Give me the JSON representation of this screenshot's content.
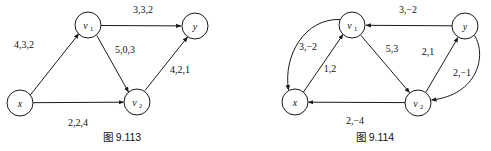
{
  "figures": [
    {
      "id": "fig-9-113",
      "caption": "图 9.113",
      "caption_x": 122,
      "caption_y": 141,
      "nodes": [
        {
          "id": "x",
          "label": "x",
          "sub": "",
          "cx": 20,
          "cy": 103,
          "r": 13
        },
        {
          "id": "v1",
          "label": "v",
          "sub": "1",
          "cx": 88,
          "cy": 25,
          "r": 13
        },
        {
          "id": "y",
          "label": "y",
          "sub": "",
          "cx": 195,
          "cy": 26,
          "r": 13
        },
        {
          "id": "v2",
          "label": "v",
          "sub": "2",
          "cx": 137,
          "cy": 102,
          "r": 13
        }
      ],
      "edges": [
        {
          "id": "x-v1",
          "from": "x",
          "to": "v1",
          "label": "4,3,2",
          "lx": 24,
          "ly": 48,
          "curve": 0
        },
        {
          "id": "v1-y",
          "from": "v1",
          "to": "y",
          "label": "3,3,2",
          "lx": 143,
          "ly": 13,
          "curve": 0
        },
        {
          "id": "v1-v2",
          "from": "v1",
          "to": "v2",
          "label": "5,0,3",
          "lx": 125,
          "ly": 53,
          "curve": 0
        },
        {
          "id": "x-v2",
          "from": "x",
          "to": "v2",
          "label": "2,2,4",
          "lx": 78,
          "ly": 126,
          "curve": 0
        },
        {
          "id": "v2-y",
          "from": "v2",
          "to": "y",
          "label": "4,2,1",
          "lx": 180,
          "ly": 73,
          "curve": 0
        }
      ]
    },
    {
      "id": "fig-9-114",
      "caption": "图 9.114",
      "caption_x": 375,
      "caption_y": 141,
      "nodes": [
        {
          "id": "x",
          "label": "x",
          "sub": "",
          "cx": 295,
          "cy": 102,
          "r": 13
        },
        {
          "id": "v1",
          "label": "v",
          "sub": "1",
          "cx": 352,
          "cy": 25,
          "r": 13
        },
        {
          "id": "y",
          "label": "y",
          "sub": "",
          "cx": 465,
          "cy": 26,
          "r": 13
        },
        {
          "id": "v2",
          "label": "v",
          "sub": "2",
          "cx": 418,
          "cy": 103,
          "r": 13
        }
      ],
      "edges": [
        {
          "id": "v1-x-curved",
          "from": "v1",
          "to": "x",
          "label": "3,−2",
          "lx": 308,
          "ly": 50,
          "curve": -1
        },
        {
          "id": "x-v1",
          "from": "x",
          "to": "v1",
          "label": "1,2",
          "lx": 330,
          "ly": 72,
          "curve": 0
        },
        {
          "id": "y-v1",
          "from": "y",
          "to": "v1",
          "label": "3,−2",
          "lx": 408,
          "ly": 13,
          "curve": 0
        },
        {
          "id": "v1-v2",
          "from": "v1",
          "to": "v2",
          "label": "5,3",
          "lx": 392,
          "ly": 52,
          "curve": 0
        },
        {
          "id": "v2-y",
          "from": "v2",
          "to": "y",
          "label": "2,1",
          "lx": 428,
          "ly": 55,
          "curve": 0
        },
        {
          "id": "y-v2-curved",
          "from": "y",
          "to": "v2",
          "label": "2,−1",
          "lx": 462,
          "ly": 76,
          "curve": 1
        },
        {
          "id": "v2-x",
          "from": "v2",
          "to": "x",
          "label": "2,−4",
          "lx": 355,
          "ly": 124,
          "curve": 0
        }
      ]
    }
  ],
  "style": {
    "stroke_color": "#1a1a1a",
    "node_fill": "#ffffff",
    "background": "#ffffff"
  }
}
